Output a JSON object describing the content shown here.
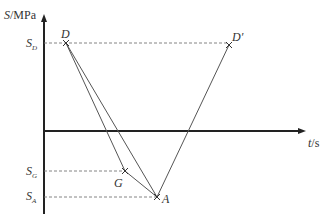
{
  "axes": {
    "y_label": "S/MPa",
    "y_label_var": "S",
    "y_label_unit": "/MPa",
    "x_label": "t/s",
    "x_label_var": "t",
    "x_label_unit": "/s"
  },
  "y_ticks": [
    {
      "id": "SD",
      "main": "S",
      "sub": "D"
    },
    {
      "id": "SG",
      "main": "S",
      "sub": "G"
    },
    {
      "id": "SA",
      "main": "S",
      "sub": "A"
    }
  ],
  "points": {
    "D": "D",
    "D_prime": "D′",
    "G": "G",
    "A": "A"
  },
  "colors": {
    "axis": "#222222",
    "line": "#555555",
    "dashed": "#777777"
  }
}
